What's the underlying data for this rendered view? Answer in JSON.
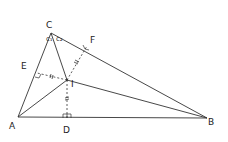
{
  "diagram": {
    "points": {
      "A": {
        "label": "A",
        "x": 18,
        "y": 117
      },
      "B": {
        "label": "B",
        "x": 207,
        "y": 118
      },
      "C": {
        "label": "C",
        "x": 51,
        "y": 33
      },
      "D": {
        "label": "D",
        "x": 67,
        "y": 118
      },
      "E": {
        "label": "E",
        "x": 37,
        "y": 73
      },
      "F": {
        "label": "F",
        "x": 87,
        "y": 46
      },
      "I": {
        "label": "I",
        "x": 67,
        "y": 80
      }
    },
    "angle_labels": {
      "c1": "c₁",
      "c2": "c₂"
    },
    "segments": [
      {
        "from": "A",
        "to": "B",
        "style": "solid"
      },
      {
        "from": "B",
        "to": "C",
        "style": "solid"
      },
      {
        "from": "C",
        "to": "A",
        "style": "solid"
      },
      {
        "from": "A",
        "to": "I",
        "style": "solid"
      },
      {
        "from": "B",
        "to": "I",
        "style": "solid"
      },
      {
        "from": "C",
        "to": "I",
        "style": "solid"
      },
      {
        "from": "I",
        "to": "D",
        "style": "dashed",
        "tick": "equal"
      },
      {
        "from": "I",
        "to": "E",
        "style": "dashed",
        "tick": "equal"
      },
      {
        "from": "I",
        "to": "F",
        "style": "dashed",
        "tick": "equal"
      }
    ],
    "right_angles": [
      "D",
      "E",
      "F"
    ],
    "colors": {
      "stroke": "#333333",
      "background": "#ffffff"
    }
  }
}
